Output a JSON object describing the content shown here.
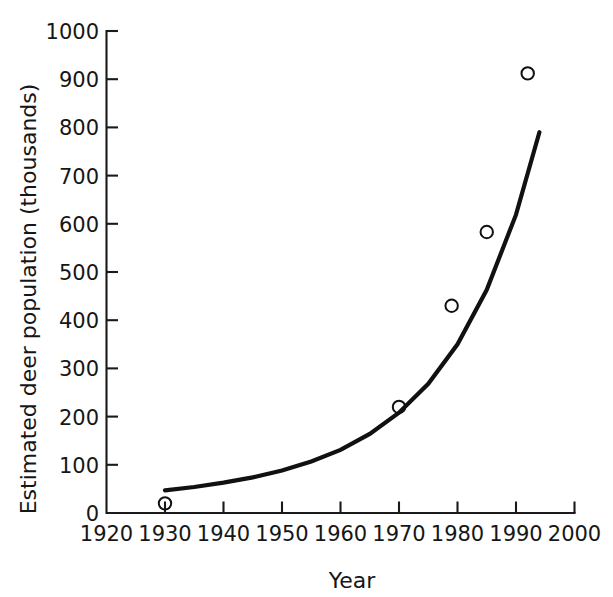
{
  "chart_data": {
    "type": "scatter",
    "title": "",
    "xlabel": "Year",
    "ylabel": "Estimated deer population (thousands)",
    "xlim": [
      1920,
      2000
    ],
    "ylim": [
      0,
      1000
    ],
    "xticks": [
      1920,
      1930,
      1940,
      1950,
      1960,
      1970,
      1980,
      1990,
      2000
    ],
    "xtick_labels": [
      "1920",
      "1930",
      "1940",
      "1950",
      "1960",
      "1970",
      "1980",
      "1990",
      "2000"
    ],
    "yticks": [
      0,
      100,
      200,
      300,
      400,
      500,
      600,
      700,
      800,
      900,
      1000
    ],
    "ytick_labels": [
      "0",
      "100",
      "200",
      "300",
      "400",
      "500",
      "600",
      "700",
      "800",
      "900",
      "1000"
    ],
    "grid": false,
    "legend": "none",
    "marker": "open-circle",
    "series": [
      {
        "name": "Estimated deer population",
        "x": [
          1930,
          1970,
          1979,
          1985,
          1992
        ],
        "y": [
          20,
          220,
          430,
          583,
          912
        ]
      },
      {
        "name": "Exponential fit curve",
        "type": "line",
        "x": [
          1930,
          1935,
          1940,
          1945,
          1950,
          1955,
          1960,
          1965,
          1970,
          1975,
          1980,
          1985,
          1990,
          1994
        ],
        "y": [
          47,
          54,
          63,
          74,
          88,
          107,
          131,
          164,
          208,
          268,
          350,
          463,
          619,
          790
        ]
      }
    ]
  },
  "axes": {
    "y_axis_title": "Estimated deer population (thousands)",
    "x_axis_title": "Year"
  }
}
